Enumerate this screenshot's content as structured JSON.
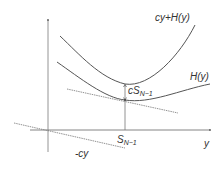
{
  "diagram": {
    "labels": {
      "upper_curve": "cy+H(y)",
      "lower_curve": "H(y)",
      "gap": "cS",
      "gap_sub": "N−1",
      "x_tick": "S",
      "x_tick_sub": "N−1",
      "x_axis": "y",
      "neg_line": "-cy"
    },
    "colors": {
      "curve": "#555555",
      "axis": "#777777",
      "dashed": "#777777",
      "text": "#333333"
    }
  }
}
